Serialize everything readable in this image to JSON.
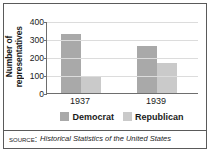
{
  "chart_data": {
    "type": "bar",
    "title": "",
    "xlabel": "",
    "ylabel": "Number of\nrepresentatives",
    "categories": [
      "1937",
      "1939"
    ],
    "series": [
      {
        "name": "Democrat",
        "color": "#a9a9a9",
        "values": [
          330,
          262
        ]
      },
      {
        "name": "Republican",
        "color": "#cacaca",
        "values": [
          88,
          169
        ]
      }
    ],
    "ylim": [
      0,
      400
    ],
    "yticks": [
      0,
      100,
      200,
      300,
      400
    ],
    "ytick_labels": [
      "0",
      "100",
      "200",
      "300",
      "400"
    ],
    "grid": true,
    "legend_position": "bottom"
  },
  "legend": {
    "items": [
      {
        "label": "Democrat",
        "color": "#a9a9a9"
      },
      {
        "label": "Republican",
        "color": "#cacaca"
      }
    ]
  },
  "footer": {
    "source_label": "Source:",
    "source_title": "Historical Statistics of the United States"
  }
}
